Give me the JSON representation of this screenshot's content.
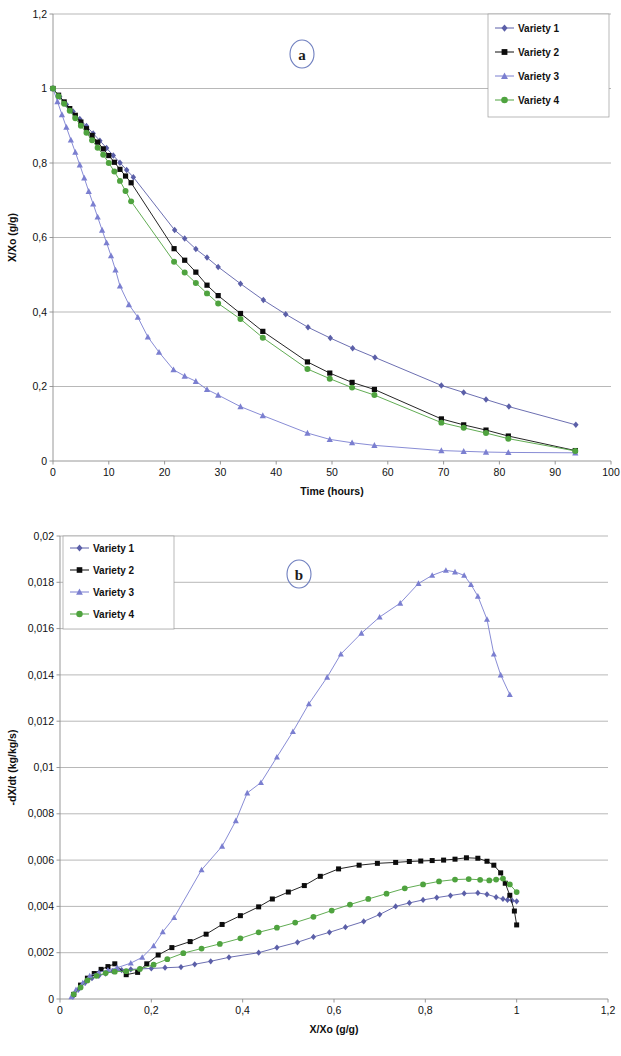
{
  "figure": {
    "panel_a_letter": "a",
    "panel_b_letter": "b"
  },
  "legend": {
    "items": [
      {
        "label": "Variety 1",
        "color": "#5b5fa8",
        "marker": "diamond"
      },
      {
        "label": "Variety 2",
        "color": "#0c0c0c",
        "marker": "square"
      },
      {
        "label": "Variety 3",
        "color": "#7b7fd0",
        "marker": "triangle"
      },
      {
        "label": "Variety 4",
        "color": "#4fa33f",
        "marker": "circle"
      }
    ]
  },
  "chart_data": [
    {
      "id": "panel-a",
      "type": "line",
      "title": "a",
      "xlabel": "Time (hours)",
      "ylabel": "X/Xo (g/g)",
      "xlim": [
        0,
        100
      ],
      "ylim": [
        0,
        1.2
      ],
      "xticks": [
        "0",
        "10",
        "20",
        "30",
        "40",
        "50",
        "60",
        "70",
        "80",
        "90",
        "100"
      ],
      "yticks": [
        "0",
        "0,2",
        "0,4",
        "0,6",
        "0,8",
        "1",
        "1,2"
      ],
      "xtick_values": [
        0,
        10,
        20,
        30,
        40,
        50,
        60,
        70,
        80,
        90,
        100
      ],
      "ytick_values": [
        0,
        0.2,
        0.4,
        0.6,
        0.8,
        1.0,
        1.2
      ],
      "grid": "horizontal",
      "legend_position": "top-right",
      "series": [
        {
          "name": "Variety 1",
          "color": "#5b5fa8",
          "marker": "diamond",
          "x": [
            0,
            1.2,
            2.4,
            3.6,
            4.8,
            6.0,
            7.2,
            8.4,
            9.6,
            10.8,
            12.0,
            13.2,
            14.4,
            21.8,
            23.6,
            25.6,
            27.6,
            29.6,
            33.6,
            37.7,
            41.7,
            45.7,
            49.7,
            53.7,
            57.7,
            69.6,
            73.6,
            77.6,
            81.7,
            93.7
          ],
          "y": [
            1.0,
            0.978,
            0.957,
            0.938,
            0.918,
            0.899,
            0.879,
            0.86,
            0.84,
            0.82,
            0.801,
            0.781,
            0.762,
            0.62,
            0.597,
            0.569,
            0.546,
            0.521,
            0.476,
            0.432,
            0.394,
            0.359,
            0.33,
            0.303,
            0.278,
            0.203,
            0.184,
            0.165,
            0.146,
            0.097
          ]
        },
        {
          "name": "Variety 2",
          "color": "#0c0c0c",
          "marker": "square",
          "x": [
            0,
            1.0,
            2.0,
            3.0,
            4.0,
            5.0,
            6.0,
            7.0,
            8.0,
            9.0,
            10.0,
            11.0,
            12.0,
            13.0,
            14.0,
            21.7,
            23.6,
            25.6,
            27.6,
            29.6,
            33.6,
            37.6,
            45.6,
            49.6,
            53.6,
            57.6,
            69.6,
            73.6,
            77.6,
            81.6,
            93.6
          ],
          "y": [
            1.0,
            0.982,
            0.964,
            0.946,
            0.928,
            0.91,
            0.892,
            0.874,
            0.856,
            0.838,
            0.82,
            0.802,
            0.783,
            0.765,
            0.747,
            0.57,
            0.539,
            0.507,
            0.472,
            0.444,
            0.396,
            0.348,
            0.266,
            0.236,
            0.211,
            0.192,
            0.113,
            0.097,
            0.083,
            0.067,
            0.028
          ]
        },
        {
          "name": "Variety 3",
          "color": "#7b7fd0",
          "marker": "triangle",
          "x": [
            0,
            0.8,
            1.6,
            2.4,
            3.2,
            4.0,
            4.8,
            5.6,
            6.4,
            7.2,
            8.0,
            8.8,
            9.6,
            10.4,
            11.2,
            12.0,
            13.6,
            15.2,
            17.0,
            19.0,
            21.6,
            23.6,
            25.6,
            27.6,
            29.6,
            33.6,
            37.6,
            45.6,
            49.6,
            53.6,
            57.6,
            69.6,
            73.6,
            77.6,
            81.6,
            93.6
          ],
          "y": [
            1.0,
            0.965,
            0.93,
            0.896,
            0.862,
            0.829,
            0.795,
            0.76,
            0.724,
            0.69,
            0.655,
            0.62,
            0.586,
            0.551,
            0.513,
            0.47,
            0.42,
            0.386,
            0.333,
            0.292,
            0.245,
            0.228,
            0.214,
            0.192,
            0.177,
            0.146,
            0.122,
            0.075,
            0.058,
            0.049,
            0.042,
            0.028,
            0.026,
            0.024,
            0.023,
            0.022
          ]
        },
        {
          "name": "Variety 4",
          "color": "#4fa33f",
          "marker": "circle",
          "x": [
            0,
            1.0,
            2.0,
            3.0,
            4.0,
            5.0,
            6.0,
            7.0,
            8.0,
            9.0,
            10.0,
            11.0,
            12.0,
            13.0,
            14.0,
            21.7,
            23.6,
            25.6,
            27.6,
            29.6,
            33.6,
            37.6,
            45.6,
            49.6,
            53.6,
            57.6,
            69.6,
            73.6,
            77.6,
            81.6,
            93.6
          ],
          "y": [
            1.0,
            0.979,
            0.959,
            0.94,
            0.92,
            0.9,
            0.881,
            0.861,
            0.841,
            0.822,
            0.8,
            0.777,
            0.752,
            0.725,
            0.697,
            0.535,
            0.506,
            0.478,
            0.45,
            0.423,
            0.381,
            0.331,
            0.247,
            0.221,
            0.197,
            0.177,
            0.103,
            0.089,
            0.075,
            0.06,
            0.027
          ]
        }
      ]
    },
    {
      "id": "panel-b",
      "type": "line",
      "title": "b",
      "xlabel": "X/Xo (g/g)",
      "ylabel": "-dX/dt (kg/kg/s)",
      "xlim": [
        0,
        1.2
      ],
      "ylim": [
        0,
        0.02
      ],
      "xticks": [
        "0",
        "0,2",
        "0,4",
        "0,6",
        "0,8",
        "1",
        "1,2"
      ],
      "yticks": [
        "0",
        "0,002",
        "0,004",
        "0,006",
        "0,008",
        "0,01",
        "0,012",
        "0,014",
        "0,016",
        "0,018",
        "0,02"
      ],
      "xtick_values": [
        0,
        0.2,
        0.4,
        0.6,
        0.8,
        1.0,
        1.2
      ],
      "ytick_values": [
        0,
        0.002,
        0.004,
        0.006,
        0.008,
        0.01,
        0.012,
        0.014,
        0.016,
        0.018,
        0.02
      ],
      "grid": "horizontal",
      "legend_position": "top-left",
      "series": [
        {
          "name": "Variety 1",
          "color": "#5b5fa8",
          "marker": "diamond",
          "x": [
            0.028,
            0.04,
            0.055,
            0.07,
            0.085,
            0.1,
            0.115,
            0.135,
            0.155,
            0.175,
            0.2,
            0.23,
            0.265,
            0.295,
            0.33,
            0.37,
            0.435,
            0.475,
            0.52,
            0.555,
            0.59,
            0.625,
            0.665,
            0.7,
            0.735,
            0.765,
            0.795,
            0.825,
            0.855,
            0.885,
            0.915,
            0.935,
            0.955,
            0.97,
            0.98,
            0.99,
            1.0
          ],
          "y": [
            0.0001,
            0.0004,
            0.0007,
            0.0009,
            0.001,
            0.0011,
            0.0012,
            0.00125,
            0.00128,
            0.0013,
            0.00132,
            0.00135,
            0.00138,
            0.0015,
            0.00163,
            0.0018,
            0.002,
            0.00222,
            0.00245,
            0.00268,
            0.00288,
            0.0031,
            0.00335,
            0.00365,
            0.004,
            0.00415,
            0.00428,
            0.00438,
            0.00447,
            0.00456,
            0.00458,
            0.00452,
            0.0044,
            0.00432,
            0.00428,
            0.00425,
            0.00422
          ]
        },
        {
          "name": "Variety 2",
          "color": "#0c0c0c",
          "marker": "square",
          "x": [
            0.03,
            0.045,
            0.06,
            0.075,
            0.09,
            0.105,
            0.12,
            0.145,
            0.17,
            0.19,
            0.215,
            0.245,
            0.285,
            0.32,
            0.355,
            0.395,
            0.435,
            0.465,
            0.5,
            0.535,
            0.57,
            0.61,
            0.655,
            0.695,
            0.735,
            0.765,
            0.79,
            0.815,
            0.84,
            0.865,
            0.89,
            0.915,
            0.935,
            0.95,
            0.965,
            0.975,
            0.985,
            0.995,
            1.0
          ],
          "y": [
            0.0002,
            0.0006,
            0.0009,
            0.0011,
            0.00128,
            0.0014,
            0.00152,
            0.00105,
            0.00115,
            0.00152,
            0.0019,
            0.00222,
            0.00248,
            0.0028,
            0.00322,
            0.0036,
            0.00398,
            0.00432,
            0.00462,
            0.0049,
            0.0053,
            0.00562,
            0.00578,
            0.00586,
            0.0059,
            0.00594,
            0.00596,
            0.00598,
            0.006,
            0.00604,
            0.0061,
            0.00608,
            0.00595,
            0.00578,
            0.00545,
            0.005,
            0.00448,
            0.0038,
            0.0032
          ]
        },
        {
          "name": "Variety 3",
          "color": "#7b7fd0",
          "marker": "triangle",
          "x": [
            0.025,
            0.035,
            0.05,
            0.065,
            0.085,
            0.105,
            0.125,
            0.155,
            0.18,
            0.205,
            0.225,
            0.25,
            0.31,
            0.355,
            0.385,
            0.41,
            0.44,
            0.475,
            0.51,
            0.545,
            0.585,
            0.615,
            0.66,
            0.7,
            0.745,
            0.785,
            0.815,
            0.845,
            0.865,
            0.885,
            0.9,
            0.915,
            0.935,
            0.95,
            0.965,
            0.985
          ],
          "y": [
            0.0001,
            0.0004,
            0.0007,
            0.001,
            0.00115,
            0.00125,
            0.00135,
            0.00155,
            0.0018,
            0.0023,
            0.0029,
            0.00352,
            0.00558,
            0.0066,
            0.0077,
            0.0089,
            0.00935,
            0.01045,
            0.01155,
            0.01275,
            0.0139,
            0.0149,
            0.0158,
            0.0165,
            0.0171,
            0.01795,
            0.0183,
            0.01852,
            0.01845,
            0.0183,
            0.0179,
            0.0174,
            0.0164,
            0.0149,
            0.014,
            0.01315
          ]
        },
        {
          "name": "Variety 4",
          "color": "#4fa33f",
          "marker": "circle",
          "x": [
            0.03,
            0.045,
            0.06,
            0.08,
            0.1,
            0.12,
            0.145,
            0.175,
            0.205,
            0.235,
            0.27,
            0.31,
            0.35,
            0.395,
            0.435,
            0.475,
            0.515,
            0.555,
            0.595,
            0.635,
            0.675,
            0.715,
            0.755,
            0.795,
            0.83,
            0.865,
            0.895,
            0.92,
            0.94,
            0.955,
            0.97,
            0.985,
            1.0
          ],
          "y": [
            0.0002,
            0.0005,
            0.0008,
            0.001,
            0.00112,
            0.00118,
            0.0012,
            0.0013,
            0.00148,
            0.00172,
            0.00198,
            0.00218,
            0.00238,
            0.00262,
            0.00288,
            0.00308,
            0.0033,
            0.00355,
            0.00382,
            0.00408,
            0.00432,
            0.00455,
            0.00478,
            0.00495,
            0.00508,
            0.00516,
            0.00518,
            0.00515,
            0.00512,
            0.00516,
            0.0052,
            0.00495,
            0.00462
          ]
        }
      ]
    }
  ]
}
